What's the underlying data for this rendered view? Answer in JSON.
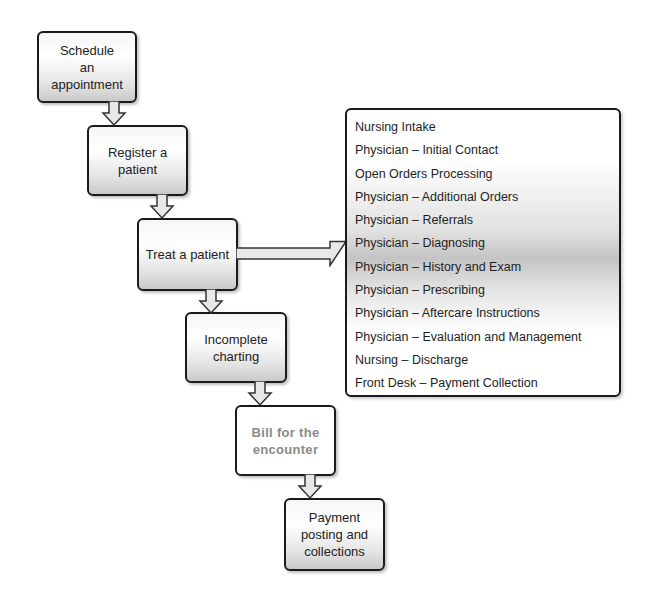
{
  "diagram": {
    "type": "flowchart",
    "steps": [
      {
        "id": "step1",
        "label": "Schedule an appointment",
        "lines": [
          "Schedule an",
          "appointment"
        ]
      },
      {
        "id": "step2",
        "label": "Register a patient",
        "lines": [
          "Register a",
          "patient"
        ]
      },
      {
        "id": "step3",
        "label": "Treat a patient",
        "lines": [
          "Treat a patient"
        ]
      },
      {
        "id": "step4",
        "label": "Incomplete charting",
        "lines": [
          "Incomplete",
          "charting"
        ]
      },
      {
        "id": "step5",
        "label": "Bill for the encounter",
        "lines": [
          "Bill for the",
          "encounter"
        ],
        "style": "highlighted-grey-text"
      },
      {
        "id": "step6",
        "label": "Payment posting and collections",
        "lines": [
          "Payment",
          "posting and",
          "collections"
        ]
      }
    ],
    "edges": [
      {
        "from": "step1",
        "to": "step2"
      },
      {
        "from": "step2",
        "to": "step3"
      },
      {
        "from": "step3",
        "to": "step4"
      },
      {
        "from": "step3",
        "to": "treat_details"
      },
      {
        "from": "step4",
        "to": "step5"
      },
      {
        "from": "step5",
        "to": "step6"
      }
    ],
    "treat_details": {
      "items": [
        "Nursing Intake",
        "Physician – Initial Contact",
        "Open Orders Processing",
        "Physician – Additional Orders",
        "Physician – Referrals",
        "Physician – Diagnosing",
        "Physician – History and Exam",
        "Physician – Prescribing",
        "Physician – Aftercare Instructions",
        "Physician – Evaluation and Management",
        "Nursing – Discharge",
        "Front Desk – Payment Collection"
      ]
    }
  },
  "colors": {
    "border": "#1a1a1a",
    "arrow_fill": "#e8e8e8",
    "highlight_text": "#8a8a8a"
  }
}
